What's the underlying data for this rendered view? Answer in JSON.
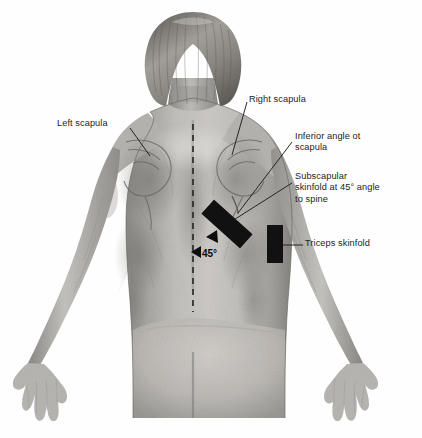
{
  "figure": {
    "subject_view": "back",
    "background_color": "#fefefe",
    "ink_color": "#232323",
    "marker_color": "#111111"
  },
  "labels": {
    "left_scapula": "Left scapula",
    "right_scapula": "Right scapula",
    "inferior_angle": "Inferior angle ot\nscapula",
    "subscapular": "Subscapular\nskinfold at 45° angle\nto spine",
    "triceps": "Triceps skinfold",
    "angle_value": "45°"
  },
  "annotations": {
    "spine_line": {
      "style": "dashed",
      "orientation": "vertical",
      "color": "#2b2b2b"
    },
    "angle_marker": {
      "value": "45°",
      "arrowheads": 2,
      "direction": "left"
    },
    "skinfold_markers": [
      {
        "name": "subscapular-skinfold-marker",
        "rotation_degrees": 45,
        "color": "#111111"
      },
      {
        "name": "triceps-skinfold-marker",
        "rotation_degrees": 0,
        "color": "#111111"
      }
    ]
  }
}
